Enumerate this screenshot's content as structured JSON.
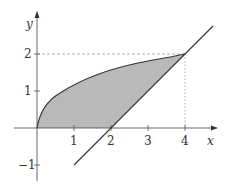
{
  "diagram": {
    "type": "region-between-curves",
    "axes": {
      "x_label": "x",
      "y_label": "y"
    },
    "x_ticks": [
      "1",
      "2",
      "3",
      "4"
    ],
    "y_ticks": [
      "2",
      "1",
      "-1"
    ],
    "curves": [
      {
        "name": "y = sqrt(x)",
        "from": 0,
        "to": 4
      },
      {
        "name": "y = x - 2",
        "from": 1,
        "to": 4.8
      }
    ],
    "guide_lines": [
      "y = 2 dashed",
      "x = 4 dotted"
    ],
    "intersection": [
      4,
      2
    ],
    "colors": {
      "fill": "#b9b9b9",
      "stroke": "#333333",
      "axis": "#555555",
      "guide": "#999999"
    }
  }
}
